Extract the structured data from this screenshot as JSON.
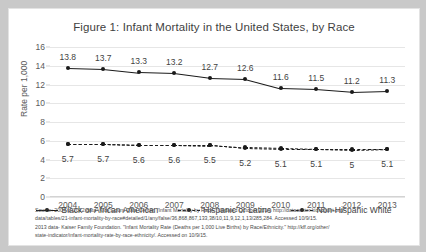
{
  "chart_data": {
    "type": "line",
    "title": "Figure 1: Infant Mortality in the United States, by Race",
    "xlabel": "",
    "ylabel": "Rate per 1,000",
    "categories": [
      "2004",
      "2005",
      "2006",
      "2007",
      "2008",
      "2009",
      "2010",
      "2011",
      "2012",
      "2013"
    ],
    "ylim": [
      0,
      16
    ],
    "yticks": [
      "0",
      "2",
      "4",
      "6",
      "8",
      "10",
      "12",
      "14",
      "16"
    ],
    "grid": true,
    "legend_position": "bottom",
    "series": [
      {
        "name": "Black or African American",
        "style": "solid",
        "labels_shown": true,
        "values": [
          13.8,
          13.7,
          13.3,
          13.2,
          12.7,
          12.6,
          11.6,
          11.5,
          11.2,
          11.3
        ]
      },
      {
        "name": "Hispanic or Latino",
        "style": "dashed",
        "labels_shown": true,
        "values": [
          5.7,
          5.7,
          5.6,
          5.6,
          5.5,
          5.2,
          5.1,
          5.1,
          5.0,
          5.1
        ]
      },
      {
        "name": "Non-Hispanic White",
        "style": "dashed",
        "labels_shown": false,
        "values": [
          5.7,
          5.7,
          5.6,
          5.6,
          5.6,
          5.3,
          5.2,
          5.1,
          5.1,
          5.1
        ]
      }
    ]
  },
  "source": {
    "line1": "Source: 2004 to 2012 data- Kids Count Data Center. \"Infant Mortality by Race.\" Updated October 2014. http://datacenter.kidscount.org/",
    "line2": "data/tables/21-infant-mortality-by-race#detailed/1/any/false/36,868,867,133,38/10,11,9,12,1,13/285,284.  Accessed 10/9/15.",
    "line3": "2013 data- Kaiser Family Foundation.  \"Infant Mortality Rate (Deaths per 1,000 Live Births) by Race/Ethnicity.\"  http://kff.org/other/",
    "line4": "state-indicator/infant-mortality-rate-by-race-ethnicity/.  Accessed on 10/9/15."
  }
}
